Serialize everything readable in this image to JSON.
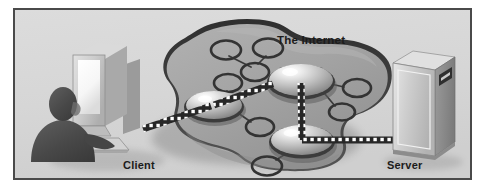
{
  "figure": {
    "type": "network-diagram",
    "background_color": "#d8d8d8",
    "frame_color": "#4a4a4a",
    "page_color": "#ffffff"
  },
  "labels": {
    "internet": "The Internet",
    "client": "Client",
    "server": "Server"
  },
  "nodes": [
    {
      "id": "client",
      "label": "Client",
      "kind": "workstation",
      "description": "person seated at desktop computer with monitor and keyboard"
    },
    {
      "id": "server",
      "label": "Server",
      "kind": "tower-server",
      "description": "tower server case with drive bay"
    },
    {
      "id": "cloud",
      "label": "The Internet",
      "kind": "cloud",
      "description": "amoeba shaped network cloud containing router nodes"
    }
  ],
  "cloud_nodes": [
    {
      "id": "hub-left",
      "kind": "dome",
      "cx": 200,
      "cy": 97,
      "rx": 30,
      "ry": 18
    },
    {
      "id": "hub-top",
      "kind": "dome",
      "cx": 286,
      "cy": 72,
      "rx": 34,
      "ry": 20
    },
    {
      "id": "hub-bottom",
      "kind": "dome",
      "cx": 287,
      "cy": 132,
      "rx": 33,
      "ry": 19
    },
    {
      "id": "leaf-1",
      "kind": "ellipse",
      "cx": 211,
      "cy": 40,
      "rx": 16,
      "ry": 10
    },
    {
      "id": "leaf-2",
      "kind": "ellipse",
      "cx": 253,
      "cy": 38,
      "rx": 16,
      "ry": 10
    },
    {
      "id": "leaf-3",
      "kind": "ellipse",
      "cx": 240,
      "cy": 62,
      "rx": 15,
      "ry": 10
    },
    {
      "id": "leaf-4",
      "kind": "ellipse",
      "cx": 214,
      "cy": 73,
      "rx": 15,
      "ry": 10
    },
    {
      "id": "leaf-5",
      "kind": "ellipse",
      "cx": 245,
      "cy": 116,
      "rx": 15,
      "ry": 10
    },
    {
      "id": "leaf-6",
      "kind": "ellipse",
      "cx": 341,
      "cy": 78,
      "rx": 15,
      "ry": 10
    },
    {
      "id": "leaf-7",
      "kind": "ellipse",
      "cx": 326,
      "cy": 101,
      "rx": 14,
      "ry": 9
    },
    {
      "id": "leaf-8",
      "kind": "ellipse",
      "cx": 253,
      "cy": 155,
      "rx": 16,
      "ry": 10
    }
  ],
  "links": [
    {
      "from": "client",
      "to": "hub-left",
      "style": "dotted-data-path"
    },
    {
      "from": "hub-left",
      "to": "hub-top",
      "style": "dotted-data-path"
    },
    {
      "from": "hub-top",
      "to": "hub-bottom",
      "style": "dotted-data-path"
    },
    {
      "from": "hub-bottom",
      "to": "server",
      "style": "dotted-data-path"
    },
    {
      "from": "leaf-1",
      "to": "leaf-3",
      "style": "thin-line"
    },
    {
      "from": "leaf-2",
      "to": "leaf-3",
      "style": "thin-line"
    },
    {
      "from": "leaf-4",
      "to": "hub-left",
      "style": "thin-line"
    },
    {
      "from": "hub-left",
      "to": "leaf-5",
      "style": "thin-line"
    },
    {
      "from": "hub-top",
      "to": "leaf-6",
      "style": "thin-line"
    },
    {
      "from": "hub-top",
      "to": "leaf-7",
      "style": "thin-line"
    },
    {
      "from": "hub-bottom",
      "to": "leaf-8",
      "style": "thin-line"
    }
  ],
  "colors": {
    "cloud_fill": "#a6a6a6",
    "cloud_rim": "#3d3d3d",
    "cloud_shadow": "#8e8e8e",
    "dome_highlight": "#f2f2f2",
    "dome_mid": "#b4b4b4",
    "dome_dark": "#6f6f6f",
    "data_path_band": "#2b2b2b",
    "data_path_dot": "#ffffff",
    "monitor_bezel": "#c9c9c9",
    "monitor_screen": "#fbfbfb",
    "person": "#4d4d4d",
    "server_body": "#c2c2c2",
    "text": "#1b1b1b"
  }
}
